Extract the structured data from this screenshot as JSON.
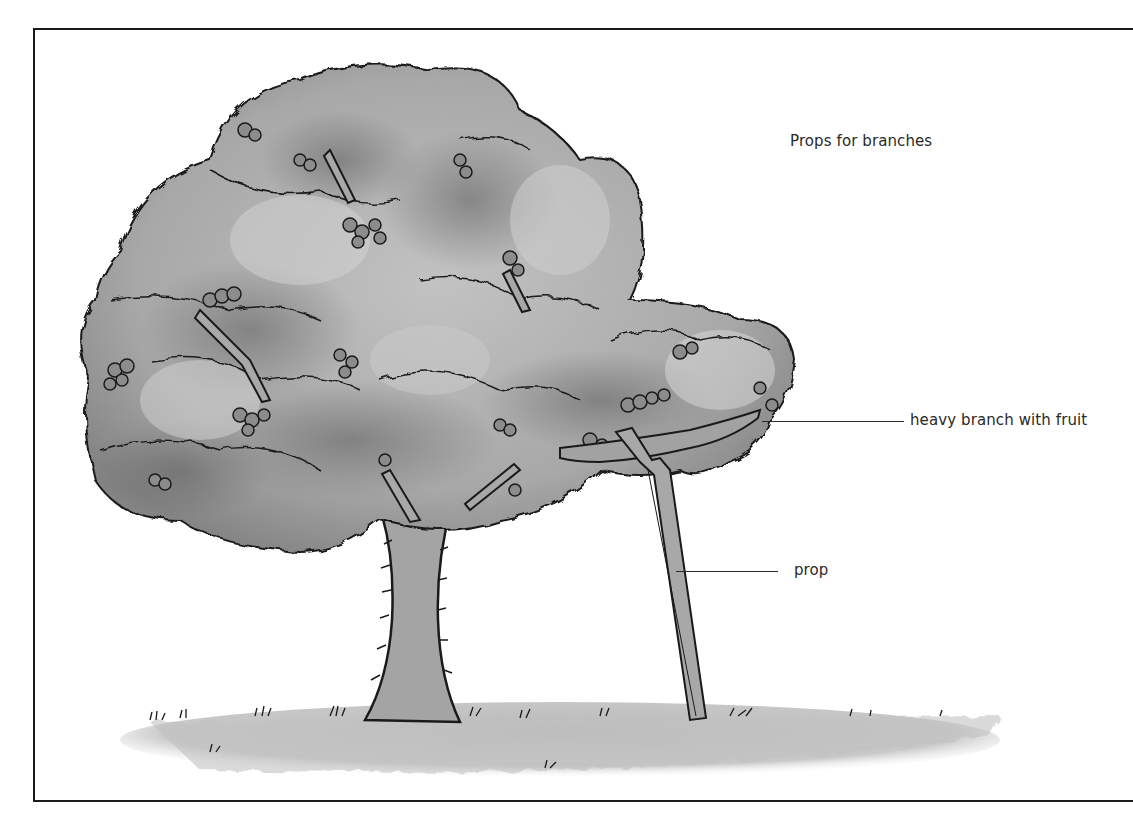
{
  "diagram": {
    "title": "Props for branches",
    "labels": [
      {
        "text": "heavy branch with fruit",
        "target": "branch"
      },
      {
        "text": "prop",
        "target": "prop"
      }
    ]
  },
  "colors": {
    "foliage_light": "#b9b9b9",
    "foliage_mid": "#9e9e9e",
    "foliage_dark": "#6f6f6f",
    "outline": "#1a1a1a",
    "fruit": "#8a8a8a",
    "trunk": "#a2a2a2",
    "ground": "#c4c4c4",
    "background": "#ffffff"
  }
}
